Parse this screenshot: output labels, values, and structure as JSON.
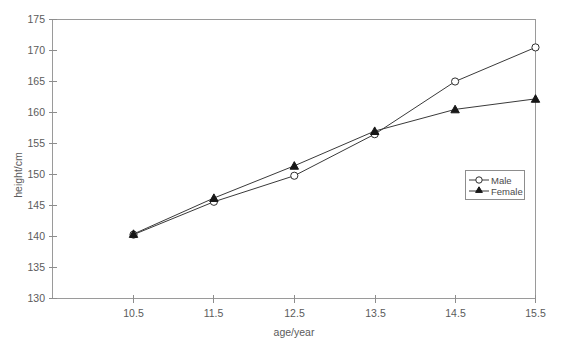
{
  "chart_data": {
    "type": "line",
    "title": "",
    "subtitle": "",
    "xlabel": "age/year",
    "ylabel": "height/cm",
    "x": [
      10.5,
      11.5,
      12.5,
      13.5,
      14.5,
      15.5
    ],
    "xticklabels": [
      "10.5",
      "11.5",
      "12.5",
      "13.5",
      "14.5",
      "15.5"
    ],
    "yticklabels": [
      "130",
      "135",
      "140",
      "145",
      "150",
      "155",
      "160",
      "165",
      "170",
      "175"
    ],
    "yticks": [
      130,
      135,
      140,
      145,
      150,
      155,
      160,
      165,
      170,
      175
    ],
    "xlim": [
      10.25,
      15.5
    ],
    "ylim": [
      130,
      175
    ],
    "grid": false,
    "legend_position": "center-right",
    "series": [
      {
        "name": "Male",
        "marker": "open-circle",
        "color": "#2e2e2e",
        "values": [
          140.3,
          145.6,
          149.8,
          156.5,
          165.0,
          170.5
        ]
      },
      {
        "name": "Female",
        "marker": "filled-triangle",
        "color": "#171717",
        "values": [
          140.4,
          146.2,
          151.4,
          157.0,
          160.5,
          162.2
        ]
      }
    ]
  },
  "legend": {
    "entries": [
      {
        "label": "Male"
      },
      {
        "label": "Female"
      }
    ]
  },
  "axes": {
    "x_title": "age/year",
    "y_title": "height/cm",
    "x_ticks": [
      "10.5",
      "11.5",
      "12.5",
      "13.5",
      "14.5",
      "15.5"
    ],
    "y_ticks": [
      "130",
      "135",
      "140",
      "145",
      "150",
      "155",
      "160",
      "165",
      "170",
      "175"
    ]
  },
  "colors": {
    "background": "#ffffff",
    "frame": "#9a9a9a",
    "text": "#5b5b5b",
    "series_male": "#2e2e2e",
    "series_female": "#171717"
  }
}
